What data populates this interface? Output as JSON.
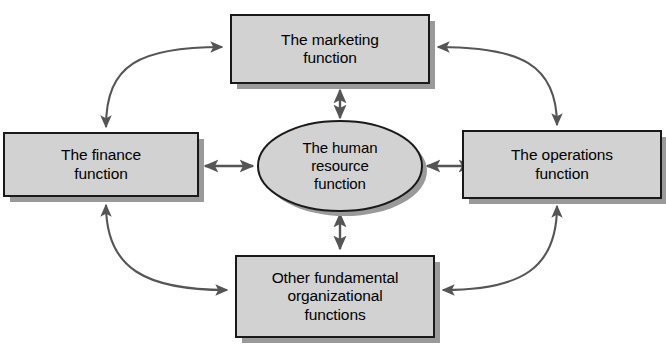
{
  "diagram": {
    "type": "cycle-hub-and-spoke",
    "title": "",
    "background_color": "#ffffff",
    "node_fill_color": "#d2d2d2",
    "node_border_color": "#1a1a1a",
    "node_shadow_color": "#9a9a9a",
    "connector_color": "#555555",
    "text_color": "#000000",
    "center": {
      "shape": "ellipse",
      "label": "The human\nresource\nfunction",
      "cx": 340,
      "cy": 166,
      "rx": 82,
      "ry": 45
    },
    "nodes": [
      {
        "id": "marketing",
        "shape": "rectangle",
        "label": "The marketing\nfunction",
        "position": "top",
        "x": 231,
        "y": 15,
        "width": 198,
        "height": 68
      },
      {
        "id": "operations",
        "shape": "rectangle",
        "label": "The operations\nfunction",
        "position": "right",
        "x": 463,
        "y": 131,
        "width": 198,
        "height": 67
      },
      {
        "id": "other-fundamental",
        "shape": "rectangle",
        "label": "Other fundamental\norganizational\nfunctions",
        "position": "bottom",
        "x": 236,
        "y": 256,
        "width": 198,
        "height": 81
      },
      {
        "id": "finance",
        "shape": "rectangle",
        "label": "The finance\nfunction",
        "position": "left",
        "x": 4,
        "y": 133,
        "width": 194,
        "height": 63
      }
    ],
    "connectors": [
      {
        "id": "center-marketing",
        "from": "center",
        "to": "marketing",
        "style": "straight",
        "arrowheads": "both"
      },
      {
        "id": "center-operations",
        "from": "center",
        "to": "operations",
        "style": "straight",
        "arrowheads": "both"
      },
      {
        "id": "center-other",
        "from": "center",
        "to": "other-fundamental",
        "style": "straight",
        "arrowheads": "both"
      },
      {
        "id": "center-finance",
        "from": "center",
        "to": "finance",
        "style": "straight",
        "arrowheads": "both"
      },
      {
        "id": "finance-marketing",
        "from": "finance",
        "to": "marketing",
        "style": "curved",
        "arrowheads": "both"
      },
      {
        "id": "marketing-operations",
        "from": "marketing",
        "to": "operations",
        "style": "curved",
        "arrowheads": "both"
      },
      {
        "id": "operations-other",
        "from": "operations",
        "to": "other-fundamental",
        "style": "curved",
        "arrowheads": "both"
      },
      {
        "id": "other-finance",
        "from": "other-fundamental",
        "to": "finance",
        "style": "curved",
        "arrowheads": "both"
      }
    ]
  }
}
